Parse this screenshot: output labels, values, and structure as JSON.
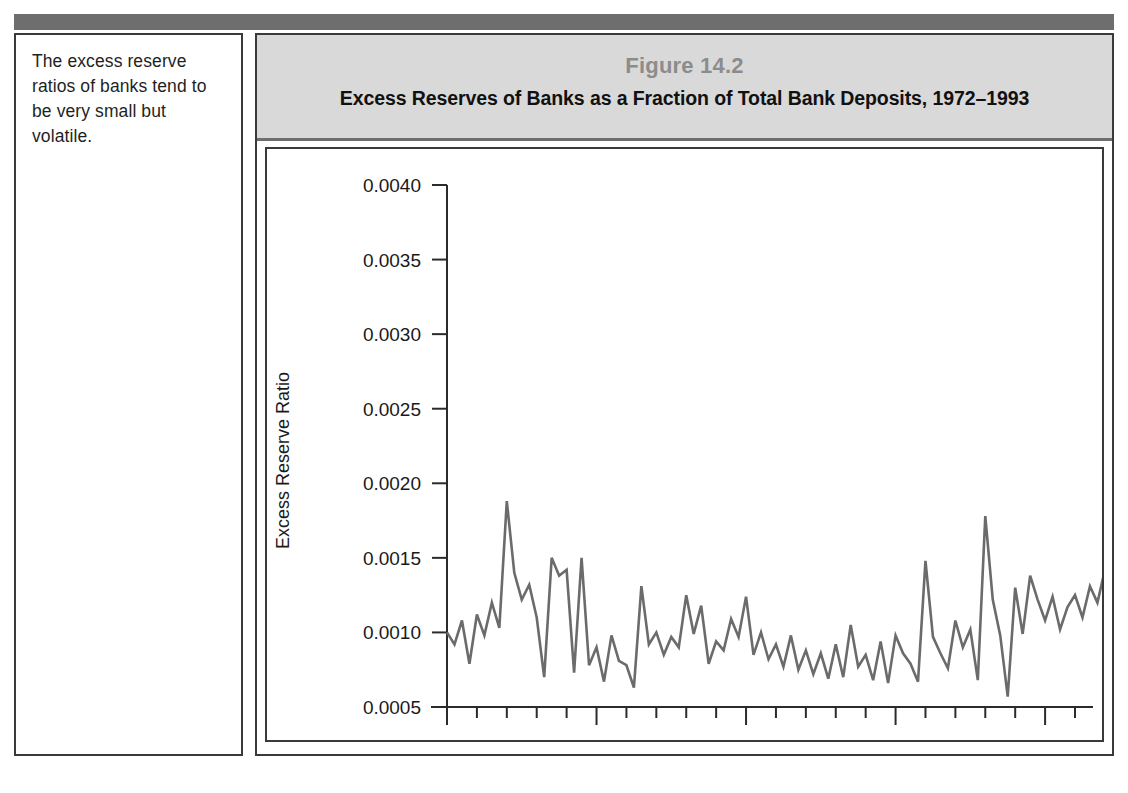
{
  "top_rule": {
    "color": "#6e6e6e"
  },
  "caption": {
    "text": "The excess reserve ratios of banks tend to be very small but volatile."
  },
  "figure": {
    "number_label": "Figure 14.2",
    "title": "Excess Reserves of Banks as a Fraction of Total Bank Deposits, 1972–1993",
    "band_color": "#d9d9d9",
    "border_color": "#3a3a3a"
  },
  "chart_data": {
    "type": "line",
    "title": "Excess Reserves of Banks as a Fraction of Total Bank Deposits, 1972–1993",
    "xlabel": "",
    "ylabel": "Excess Reserve Ratio",
    "line_color": "#6b6b6b",
    "grid": false,
    "legend": null,
    "xlim": [
      1972.0,
      1993.0
    ],
    "ylim": [
      0.0005,
      0.004
    ],
    "ytick_values": [
      0.0005,
      0.001,
      0.0015,
      0.002,
      0.0025,
      0.003,
      0.0035,
      0.004
    ],
    "ytick_labels": [
      "0.0005",
      "0.0010",
      "0.0015",
      "0.0020",
      "0.0025",
      "0.0030",
      "0.0035",
      "0.0040"
    ],
    "xtick_values": [
      1972,
      1977,
      1982,
      1987,
      1992
    ],
    "xtick_labels": [
      "'72",
      "'77",
      "'82",
      "'87",
      "'92"
    ],
    "x_minor_step": 1,
    "x_start": 1972.0,
    "x_step": 0.25,
    "annotations": [
      {
        "text": "peak spike",
        "x": 1991.0,
        "y": 0.00385
      }
    ],
    "values": [
      0.001,
      0.00092,
      0.00108,
      0.00079,
      0.00112,
      0.00098,
      0.0012,
      0.00103,
      0.00188,
      0.0014,
      0.00122,
      0.00132,
      0.0011,
      0.0007,
      0.0015,
      0.00138,
      0.00142,
      0.00073,
      0.0015,
      0.00078,
      0.0009,
      0.00067,
      0.00098,
      0.00081,
      0.00078,
      0.00063,
      0.00131,
      0.00092,
      0.001,
      0.00085,
      0.00097,
      0.0009,
      0.00125,
      0.00099,
      0.00118,
      0.00079,
      0.00094,
      0.00088,
      0.00109,
      0.00097,
      0.00124,
      0.00085,
      0.001,
      0.00082,
      0.00092,
      0.00077,
      0.00098,
      0.00075,
      0.00088,
      0.00072,
      0.00086,
      0.00069,
      0.00092,
      0.0007,
      0.00105,
      0.00077,
      0.00085,
      0.00068,
      0.00094,
      0.00066,
      0.00098,
      0.00086,
      0.00079,
      0.00067,
      0.00148,
      0.00097,
      0.00086,
      0.00076,
      0.00108,
      0.0009,
      0.00102,
      0.00068,
      0.00178,
      0.00122,
      0.00098,
      0.00057,
      0.0013,
      0.00099,
      0.00138,
      0.00122,
      0.00108,
      0.00124,
      0.00102,
      0.00117,
      0.00125,
      0.0011,
      0.00131,
      0.0012,
      0.00142,
      0.00134,
      0.00139,
      0.00125,
      0.00138,
      0.00142,
      0.0014,
      0.00136,
      0.00149,
      0.00144,
      0.00152,
      0.00147,
      0.00245,
      0.00175,
      0.00148,
      0.0017,
      0.00197,
      0.00176,
      0.00201,
      0.00172,
      0.00175,
      0.0016,
      0.00222,
      0.00178,
      0.00211,
      0.0014,
      0.00253,
      0.00171,
      0.00209,
      0.00185,
      0.00197,
      0.0016,
      0.00222,
      0.00156,
      0.00238,
      0.00196,
      0.00214,
      0.00184,
      0.00257,
      0.00215,
      0.00199,
      0.00175,
      0.00226,
      0.00222,
      0.00175,
      0.00151,
      0.00196,
      0.0018,
      0.00204,
      0.0018,
      0.00238,
      0.00173,
      0.00184,
      0.00163,
      0.00196,
      0.00177,
      0.0019,
      0.00176,
      0.00191,
      0.00174,
      0.00188,
      0.0017,
      0.00182,
      0.00168,
      0.00178,
      0.00159,
      0.0018,
      0.0014,
      0.00385,
      0.00176,
      0.0017,
      0.00165,
      0.00152,
      0.00139,
      0.00165,
      0.00131,
      0.00152,
      0.0014,
      0.00144,
      0.00139,
      0.0016,
      0.00152,
      0.00147,
      0.00158
    ]
  }
}
